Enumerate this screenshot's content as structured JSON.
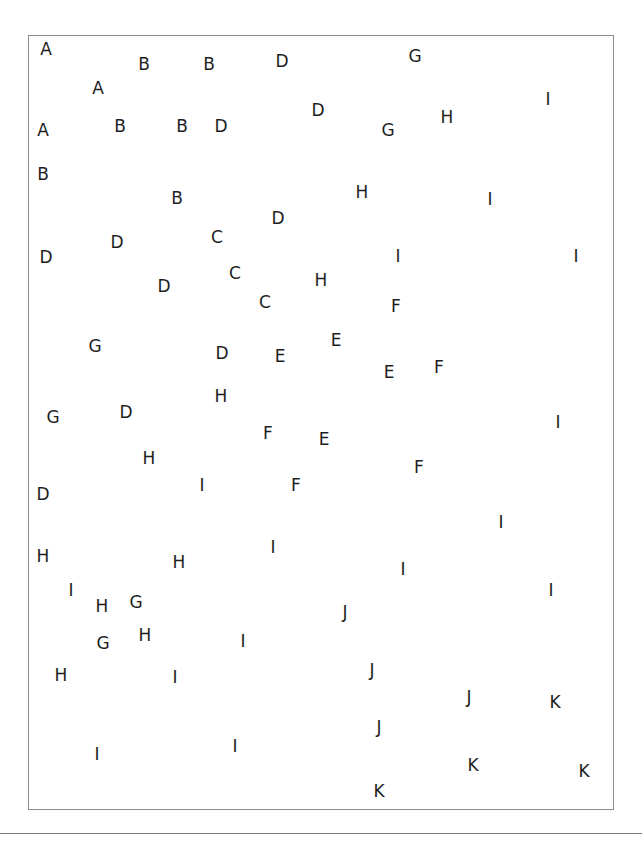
{
  "figure": {
    "frame": {
      "left": 28,
      "top": 35,
      "width": 586,
      "height": 775,
      "border_color": "#8c8c8c"
    },
    "rule": {
      "y": 833,
      "color": "#7a7a7a"
    },
    "text_color": "#1e1e1e",
    "letters": [
      {
        "char": "A",
        "x": 46,
        "y": 49
      },
      {
        "char": "A",
        "x": 98,
        "y": 88
      },
      {
        "char": "B",
        "x": 144,
        "y": 64
      },
      {
        "char": "B",
        "x": 209,
        "y": 64
      },
      {
        "char": "D",
        "x": 282,
        "y": 61
      },
      {
        "char": "G",
        "x": 415,
        "y": 56
      },
      {
        "char": "I",
        "x": 548,
        "y": 99
      },
      {
        "char": "A",
        "x": 43,
        "y": 130
      },
      {
        "char": "B",
        "x": 120,
        "y": 126
      },
      {
        "char": "B",
        "x": 182,
        "y": 126
      },
      {
        "char": "D",
        "x": 221,
        "y": 126
      },
      {
        "char": "D",
        "x": 318,
        "y": 110
      },
      {
        "char": "G",
        "x": 388,
        "y": 130
      },
      {
        "char": "H",
        "x": 447,
        "y": 117
      },
      {
        "char": "B",
        "x": 43,
        "y": 174
      },
      {
        "char": "B",
        "x": 177,
        "y": 198
      },
      {
        "char": "H",
        "x": 362,
        "y": 192
      },
      {
        "char": "I",
        "x": 490,
        "y": 199
      },
      {
        "char": "D",
        "x": 278,
        "y": 218
      },
      {
        "char": "D",
        "x": 46,
        "y": 257
      },
      {
        "char": "D",
        "x": 117,
        "y": 242
      },
      {
        "char": "C",
        "x": 217,
        "y": 237
      },
      {
        "char": "C",
        "x": 235,
        "y": 273
      },
      {
        "char": "C",
        "x": 265,
        "y": 302
      },
      {
        "char": "D",
        "x": 164,
        "y": 286
      },
      {
        "char": "H",
        "x": 321,
        "y": 280
      },
      {
        "char": "I",
        "x": 398,
        "y": 256
      },
      {
        "char": "I",
        "x": 576,
        "y": 256
      },
      {
        "char": "F",
        "x": 396,
        "y": 306
      },
      {
        "char": "G",
        "x": 95,
        "y": 346
      },
      {
        "char": "D",
        "x": 222,
        "y": 353
      },
      {
        "char": "E",
        "x": 280,
        "y": 356
      },
      {
        "char": "E",
        "x": 336,
        "y": 340
      },
      {
        "char": "E",
        "x": 389,
        "y": 372
      },
      {
        "char": "F",
        "x": 439,
        "y": 367
      },
      {
        "char": "H",
        "x": 221,
        "y": 396
      },
      {
        "char": "G",
        "x": 53,
        "y": 417
      },
      {
        "char": "D",
        "x": 126,
        "y": 412
      },
      {
        "char": "F",
        "x": 268,
        "y": 433
      },
      {
        "char": "E",
        "x": 324,
        "y": 439
      },
      {
        "char": "I",
        "x": 558,
        "y": 422
      },
      {
        "char": "H",
        "x": 149,
        "y": 458
      },
      {
        "char": "F",
        "x": 419,
        "y": 467
      },
      {
        "char": "I",
        "x": 202,
        "y": 485
      },
      {
        "char": "F",
        "x": 296,
        "y": 485
      },
      {
        "char": "D",
        "x": 43,
        "y": 494
      },
      {
        "char": "I",
        "x": 501,
        "y": 522
      },
      {
        "char": "H",
        "x": 43,
        "y": 556
      },
      {
        "char": "H",
        "x": 179,
        "y": 562
      },
      {
        "char": "I",
        "x": 273,
        "y": 547
      },
      {
        "char": "I",
        "x": 403,
        "y": 569
      },
      {
        "char": "I",
        "x": 551,
        "y": 590
      },
      {
        "char": "I",
        "x": 71,
        "y": 590
      },
      {
        "char": "H",
        "x": 102,
        "y": 606
      },
      {
        "char": "G",
        "x": 136,
        "y": 602
      },
      {
        "char": "J",
        "x": 345,
        "y": 612
      },
      {
        "char": "G",
        "x": 103,
        "y": 643
      },
      {
        "char": "H",
        "x": 145,
        "y": 635
      },
      {
        "char": "I",
        "x": 243,
        "y": 641
      },
      {
        "char": "H",
        "x": 61,
        "y": 675
      },
      {
        "char": "I",
        "x": 175,
        "y": 677
      },
      {
        "char": "J",
        "x": 372,
        "y": 670
      },
      {
        "char": "J",
        "x": 469,
        "y": 697
      },
      {
        "char": "K",
        "x": 555,
        "y": 702
      },
      {
        "char": "J",
        "x": 379,
        "y": 727
      },
      {
        "char": "I",
        "x": 97,
        "y": 754
      },
      {
        "char": "I",
        "x": 235,
        "y": 746
      },
      {
        "char": "K",
        "x": 473,
        "y": 765
      },
      {
        "char": "K",
        "x": 584,
        "y": 771
      },
      {
        "char": "K",
        "x": 379,
        "y": 791
      }
    ]
  }
}
